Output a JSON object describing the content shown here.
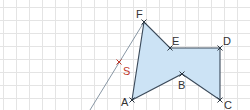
{
  "diagram": {
    "grid": {
      "spacing": 13,
      "offset_x": 3.5,
      "offset_y": 7.5,
      "color": "#e4e4e4"
    },
    "polygon": {
      "vertices": [
        "A",
        "B",
        "C",
        "D",
        "E",
        "F"
      ],
      "fill": "#cce3f5",
      "stroke": "#3b4a5a"
    },
    "points": {
      "A": {
        "label": "A",
        "x": 132,
        "y": 100
      },
      "B": {
        "label": "B",
        "x": 182,
        "y": 74
      },
      "C": {
        "label": "C",
        "x": 220,
        "y": 100
      },
      "D": {
        "label": "D",
        "x": 220,
        "y": 48
      },
      "E": {
        "label": "E",
        "x": 170,
        "y": 48
      },
      "F": {
        "label": "F",
        "x": 144,
        "y": 22
      },
      "S": {
        "label": "S",
        "x": 119,
        "y": 62,
        "color": "#c0392b"
      }
    },
    "line": {
      "from": [
        144,
        22
      ],
      "to": [
        90,
        110
      ],
      "color": "#7a8a9a"
    }
  }
}
